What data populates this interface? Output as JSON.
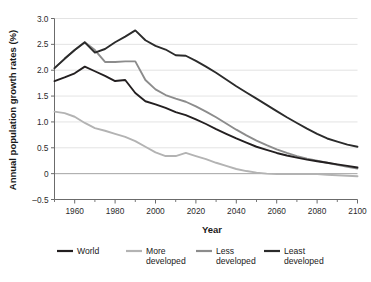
{
  "chart_data": {
    "type": "line",
    "title": "",
    "xlabel": "Year",
    "ylabel": "Annual population growth rates (%)",
    "xlim": [
      1950,
      2100
    ],
    "ylim": [
      -0.5,
      3.0
    ],
    "grid": "horizontal",
    "legend_position": "bottom",
    "y_ticks": [
      "3.0",
      "2.5",
      "2.0",
      "1.5",
      "1.0",
      "0.5",
      "0",
      "-0.5"
    ],
    "y_tick_values": [
      3.0,
      2.5,
      2.0,
      1.5,
      1.0,
      0.5,
      0,
      -0.5
    ],
    "x_ticks": [
      "1960",
      "1980",
      "2000",
      "2020",
      "2040",
      "2060",
      "2080",
      "2100"
    ],
    "x_tick_values": [
      1960,
      1980,
      2000,
      2020,
      2040,
      2060,
      2080,
      2100
    ],
    "x_minor_ticks": [
      1950,
      1970,
      1990,
      2010,
      2030,
      2050,
      2070,
      2090
    ],
    "x": [
      1950,
      1955,
      1960,
      1965,
      1970,
      1975,
      1980,
      1985,
      1990,
      1995,
      2000,
      2005,
      2010,
      2015,
      2020,
      2025,
      2030,
      2035,
      2040,
      2045,
      2050,
      2055,
      2060,
      2065,
      2070,
      2075,
      2080,
      2085,
      2090,
      2095,
      2100
    ],
    "series": [
      {
        "name": "World",
        "color": "#231f20",
        "values": [
          1.79,
          1.86,
          1.94,
          2.07,
          1.98,
          1.89,
          1.79,
          1.81,
          1.56,
          1.4,
          1.34,
          1.27,
          1.19,
          1.13,
          1.05,
          0.96,
          0.86,
          0.77,
          0.68,
          0.6,
          0.52,
          0.46,
          0.4,
          0.35,
          0.31,
          0.27,
          0.24,
          0.21,
          0.18,
          0.15,
          0.12
        ]
      },
      {
        "name": "More developed",
        "color": "#b3b3b3",
        "values": [
          1.2,
          1.17,
          1.1,
          0.98,
          0.88,
          0.83,
          0.77,
          0.71,
          0.63,
          0.52,
          0.41,
          0.34,
          0.34,
          0.4,
          0.34,
          0.28,
          0.21,
          0.15,
          0.09,
          0.05,
          0.02,
          0.0,
          -0.01,
          -0.01,
          -0.01,
          -0.01,
          -0.01,
          -0.02,
          -0.03,
          -0.04,
          -0.05
        ]
      },
      {
        "name": "Less developed",
        "color": "#8c8c8c",
        "values": [
          2.04,
          2.22,
          2.39,
          2.54,
          2.39,
          2.16,
          2.16,
          2.17,
          2.17,
          1.81,
          1.63,
          1.52,
          1.45,
          1.39,
          1.3,
          1.2,
          1.09,
          0.97,
          0.85,
          0.74,
          0.64,
          0.55,
          0.47,
          0.4,
          0.34,
          0.29,
          0.25,
          0.21,
          0.17,
          0.13,
          0.1
        ]
      },
      {
        "name": "Least developed",
        "color": "#2b2b2b",
        "values": [
          2.04,
          2.22,
          2.39,
          2.54,
          2.34,
          2.41,
          2.54,
          2.65,
          2.77,
          2.58,
          2.47,
          2.4,
          2.29,
          2.28,
          2.18,
          2.07,
          1.95,
          1.82,
          1.69,
          1.57,
          1.45,
          1.33,
          1.21,
          1.09,
          0.98,
          0.87,
          0.77,
          0.68,
          0.62,
          0.56,
          0.52
        ]
      }
    ]
  },
  "legend": {
    "items": [
      {
        "label_line1": "World",
        "label_line2": "",
        "color": "#231f20"
      },
      {
        "label_line1": "More",
        "label_line2": "developed",
        "color": "#b3b3b3"
      },
      {
        "label_line1": "Less",
        "label_line2": "developed",
        "color": "#8c8c8c"
      },
      {
        "label_line1": "Least",
        "label_line2": "developed",
        "color": "#2b2b2b"
      }
    ]
  },
  "style": {
    "grid_color": "#dcdcdc",
    "axis_color": "#6b6b6b",
    "text_color": "#1a1a1a",
    "background": "#ffffff"
  }
}
